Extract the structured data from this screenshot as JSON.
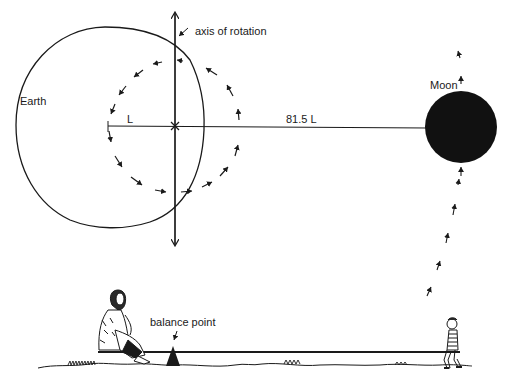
{
  "labels": {
    "axis": "axis of rotation",
    "earth": "Earth",
    "moon": "Moon",
    "short_distance": "L",
    "long_distance": "81.5 L",
    "balance": "balance point"
  },
  "colors": {
    "ink": "#1a1a1a",
    "background": "#ffffff"
  },
  "figures": {
    "left_person": "woman-seated",
    "right_person": "boy-seated"
  }
}
